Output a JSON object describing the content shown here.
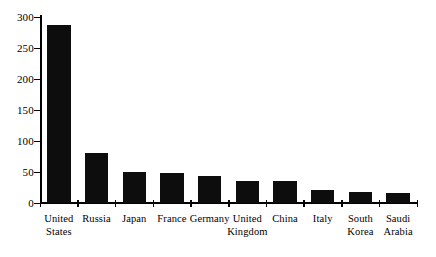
{
  "chart_data": {
    "type": "bar",
    "title": "",
    "subtitle": "",
    "xlabel": "",
    "ylabel": "",
    "categories": [
      "United States",
      "Russia",
      "Japan",
      "France",
      "Germany",
      "United Kingdom",
      "China",
      "Italy",
      "South Korea",
      "Saudi Arabia"
    ],
    "category_lines": [
      [
        "United",
        "States"
      ],
      [
        "Russia"
      ],
      [
        "Japan"
      ],
      [
        "France"
      ],
      [
        "Germany"
      ],
      [
        "United",
        "Kingdom"
      ],
      [
        "China"
      ],
      [
        "Italy"
      ],
      [
        "South",
        "Korea"
      ],
      [
        "Saudi",
        "Arabia"
      ]
    ],
    "values": [
      287,
      81,
      50,
      49,
      44,
      36,
      35,
      21,
      17,
      16
    ],
    "ylim": [
      0,
      300
    ],
    "yticks": [
      0,
      50,
      100,
      150,
      200,
      250,
      300
    ],
    "ytick_labels": [
      "0",
      "50",
      "100",
      "150",
      "200",
      "250",
      "300"
    ],
    "grid": false,
    "legend": false,
    "legend_position": "none",
    "bar_color": "#0d0d0d",
    "axis_color": "#000000",
    "background_color": "#ffffff"
  }
}
